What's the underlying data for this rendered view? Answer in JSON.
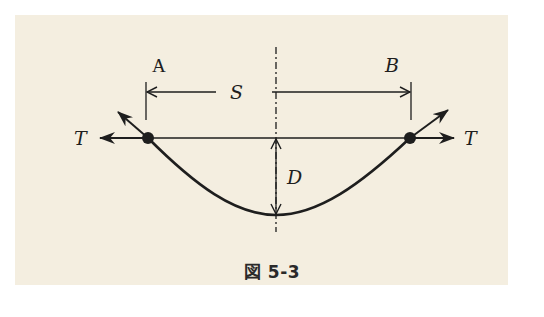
{
  "figure": {
    "caption": "図 5-3",
    "background_color": "#f4eee0",
    "line_color": "#1e1e1e"
  },
  "labels": {
    "support_left": "A",
    "support_right": "B",
    "span": "S",
    "sag": "D",
    "tension_left": "T",
    "tension_right": "T"
  },
  "geometry": {
    "support_left_point": [
      148,
      138
    ],
    "support_right_point": [
      410,
      138
    ],
    "lowest_point": [
      276,
      215
    ],
    "center_axis_x": 276,
    "span_dimension_y": 92
  }
}
